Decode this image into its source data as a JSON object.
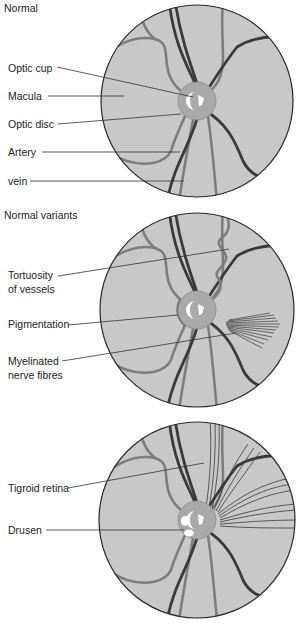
{
  "panels": [
    {
      "title": "Normal",
      "labels": [
        {
          "text": "Optic cup"
        },
        {
          "text": "Macula"
        },
        {
          "text": "Optic disc"
        },
        {
          "text": "Artery"
        },
        {
          "text": "vein"
        }
      ]
    },
    {
      "title": "Normal variants",
      "labels": [
        {
          "line1": "Tortuosity",
          "line2": "of vessels"
        },
        {
          "text": "Pigmentation"
        },
        {
          "line1": "Myelinated",
          "line2": "nerve fibres"
        }
      ]
    },
    {
      "title": "",
      "labels": [
        {
          "text": "Tigroid retina"
        },
        {
          "text": "Drusen"
        }
      ]
    }
  ],
  "colors": {
    "fundus": "#c8c8c8",
    "disc": "#a9a9a9",
    "artery": "#7d7d7d",
    "vein": "#3a3a3a",
    "outline": "#2a2a2a"
  }
}
